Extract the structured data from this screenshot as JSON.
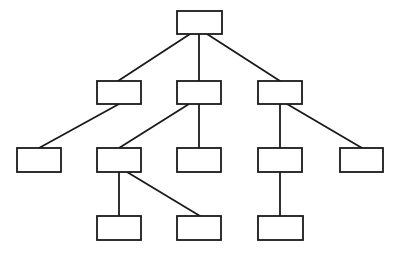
{
  "diagram": {
    "type": "tree",
    "background": "#ffffff",
    "stroke_color": "#1a1a1a",
    "nodes": [
      {
        "id": "root",
        "label": "",
        "x": 177,
        "y": 11,
        "w": 45,
        "h": 23
      },
      {
        "id": "l1a",
        "label": "",
        "x": 97,
        "y": 81,
        "w": 44,
        "h": 23
      },
      {
        "id": "l1b",
        "label": "",
        "x": 177,
        "y": 81,
        "w": 44,
        "h": 23
      },
      {
        "id": "l1c",
        "label": "",
        "x": 258,
        "y": 81,
        "w": 44,
        "h": 23
      },
      {
        "id": "l2a",
        "label": "",
        "x": 17,
        "y": 148,
        "w": 44,
        "h": 24
      },
      {
        "id": "l2b",
        "label": "",
        "x": 97,
        "y": 148,
        "w": 44,
        "h": 24
      },
      {
        "id": "l2c",
        "label": "",
        "x": 177,
        "y": 148,
        "w": 44,
        "h": 24
      },
      {
        "id": "l2d",
        "label": "",
        "x": 258,
        "y": 148,
        "w": 44,
        "h": 24
      },
      {
        "id": "l2e",
        "label": "",
        "x": 340,
        "y": 148,
        "w": 43,
        "h": 24
      },
      {
        "id": "l3a",
        "label": "",
        "x": 97,
        "y": 216,
        "w": 44,
        "h": 24
      },
      {
        "id": "l3b",
        "label": "",
        "x": 177,
        "y": 216,
        "w": 44,
        "h": 24
      },
      {
        "id": "l3c",
        "label": "",
        "x": 258,
        "y": 216,
        "w": 45,
        "h": 24
      }
    ],
    "edges": [
      {
        "from": "root",
        "to": "l1a",
        "x1": 190,
        "y1": 34,
        "x2": 118,
        "y2": 81
      },
      {
        "from": "root",
        "to": "l1b",
        "x1": 199,
        "y1": 34,
        "x2": 199,
        "y2": 81
      },
      {
        "from": "root",
        "to": "l1c",
        "x1": 207,
        "y1": 34,
        "x2": 280,
        "y2": 81
      },
      {
        "from": "l1a",
        "to": "l2a",
        "x1": 119,
        "y1": 104,
        "x2": 39,
        "y2": 148
      },
      {
        "from": "l1b",
        "to": "l2b",
        "x1": 189,
        "y1": 104,
        "x2": 119,
        "y2": 148
      },
      {
        "from": "l1b",
        "to": "l2c",
        "x1": 199,
        "y1": 104,
        "x2": 199,
        "y2": 148
      },
      {
        "from": "l1c",
        "to": "l2d",
        "x1": 280,
        "y1": 104,
        "x2": 280,
        "y2": 148
      },
      {
        "from": "l1c",
        "to": "l2e",
        "x1": 287,
        "y1": 104,
        "x2": 362,
        "y2": 148
      },
      {
        "from": "l2b",
        "to": "l3a",
        "x1": 119,
        "y1": 172,
        "x2": 119,
        "y2": 216
      },
      {
        "from": "l2b",
        "to": "l3b",
        "x1": 127,
        "y1": 172,
        "x2": 200,
        "y2": 216
      },
      {
        "from": "l2d",
        "to": "l3c",
        "x1": 280,
        "y1": 172,
        "x2": 280,
        "y2": 216
      }
    ]
  }
}
